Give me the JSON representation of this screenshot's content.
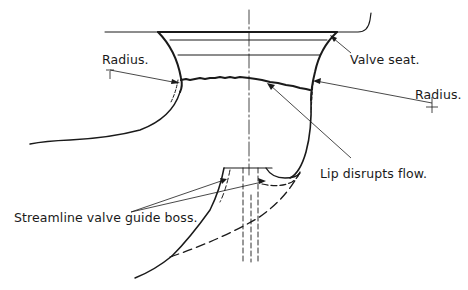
{
  "diagram": {
    "type": "technical-cross-section",
    "colors": {
      "background": "#ffffff",
      "ink": "#1a1a1a"
    }
  },
  "labels": {
    "radius_left": "Radius.",
    "valve_seat": "Valve seat.",
    "radius_right": "Radius.",
    "lip": "Lip disrupts flow.",
    "guide_boss": "Streamline valve guide boss."
  }
}
